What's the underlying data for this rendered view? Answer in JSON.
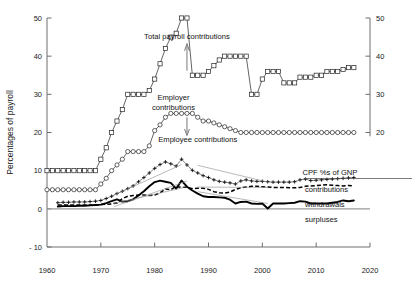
{
  "chart_data": {
    "type": "line",
    "title": "",
    "xlabel": "",
    "ylabel": "Percentages of payroll",
    "xlim": [
      1960,
      2020
    ],
    "ylim": [
      -10,
      50
    ],
    "xticks": [
      "1960",
      "1970",
      "1980",
      "1990",
      "2000",
      "2010",
      "2020"
    ],
    "xtick_values": [
      1960,
      1970,
      1980,
      1990,
      2000,
      2010,
      2020
    ],
    "yticks_left": [
      "50",
      "40",
      "30",
      "20",
      "10",
      "0",
      "- 10"
    ],
    "ytick_values_left": [
      50,
      40,
      30,
      20,
      10,
      0,
      -10
    ],
    "yticks_right": [
      "50",
      "40",
      "30",
      "20"
    ],
    "ytick_values_right": [
      50,
      40,
      30,
      20
    ],
    "grid": false,
    "legend_position": "right-inside",
    "legend_title": "CPF %s of GNP",
    "annotations": [
      {
        "text": "Total payroll contributions",
        "x": 1986,
        "y": 44.5
      },
      {
        "text": "Employer",
        "x": 1983.5,
        "y": 28.5
      },
      {
        "text": "contributions",
        "x": 1983.5,
        "y": 26.0
      },
      {
        "text": "Employee contributions",
        "x": 1988,
        "y": 17.5
      }
    ],
    "series": [
      {
        "name": "Total payroll contributions",
        "marker": "square",
        "x": [
          1960,
          1961,
          1962,
          1963,
          1964,
          1965,
          1966,
          1967,
          1968,
          1969,
          1970,
          1971,
          1972,
          1973,
          1974,
          1975,
          1976,
          1977,
          1978,
          1979,
          1980,
          1981,
          1982,
          1983,
          1984,
          1985,
          1986,
          1987,
          1988,
          1989,
          1990,
          1991,
          1992,
          1993,
          1994,
          1995,
          1996,
          1997,
          1998,
          1999,
          2000,
          2001,
          2002,
          2003,
          2004,
          2005,
          2006,
          2007,
          2008,
          2009,
          2010,
          2011,
          2012,
          2013,
          2014,
          2015,
          2016,
          2017
        ],
        "values": [
          10,
          10,
          10,
          10,
          10,
          10,
          10,
          10,
          10,
          10,
          13,
          16,
          20,
          23,
          26,
          30,
          30,
          30,
          30,
          31,
          34,
          38,
          42,
          45,
          46,
          50,
          50,
          35,
          35,
          35,
          36,
          37.5,
          39,
          40,
          40,
          40,
          40,
          40,
          30,
          30,
          34,
          36,
          36,
          36,
          33,
          33,
          33,
          34.5,
          34.5,
          34.5,
          35,
          35,
          36,
          36,
          36,
          36.5,
          37,
          37
        ]
      },
      {
        "name": "Employer contributions",
        "marker": "circle",
        "x": [
          1960,
          1961,
          1962,
          1963,
          1964,
          1965,
          1966,
          1967,
          1968,
          1969,
          1970,
          1971,
          1972,
          1973,
          1974,
          1975,
          1976,
          1977,
          1978,
          1979,
          1980,
          1981,
          1982,
          1983,
          1984,
          1985,
          1986,
          1987,
          1988,
          1989,
          1990,
          1991,
          1992,
          1993,
          1994,
          1995,
          1996,
          1997,
          1998,
          1999,
          2000,
          2001,
          2002,
          2003,
          2004,
          2005,
          2006,
          2007,
          2008,
          2009,
          2010,
          2011,
          2012,
          2013,
          2014,
          2015,
          2016,
          2017
        ],
        "values": [
          5,
          5,
          5,
          5,
          5,
          5,
          5,
          5,
          5,
          5,
          6.5,
          8,
          10,
          11.5,
          13,
          15,
          15,
          15,
          15,
          16.5,
          20.5,
          22,
          24,
          25,
          25,
          25,
          25,
          25,
          24,
          23,
          23,
          22.5,
          22,
          21.5,
          21,
          20.5,
          20,
          20,
          20,
          20,
          20,
          20,
          20,
          20,
          20,
          20,
          20,
          20,
          20,
          20,
          20,
          20,
          20,
          20,
          20,
          20,
          20,
          20
        ]
      },
      {
        "name": "contributions",
        "marker": "plus",
        "x": [
          1962,
          1963,
          1964,
          1965,
          1966,
          1967,
          1968,
          1969,
          1970,
          1971,
          1972,
          1973,
          1974,
          1975,
          1976,
          1977,
          1978,
          1979,
          1980,
          1981,
          1982,
          1983,
          1984,
          1985,
          1986,
          1987,
          1988,
          1989,
          1990,
          1991,
          1992,
          1993,
          1994,
          1995,
          1996,
          1997,
          1998,
          1999,
          2000,
          2001,
          2002,
          2003,
          2004,
          2005,
          2006,
          2007,
          2008,
          2009,
          2010,
          2011,
          2012,
          2013,
          2014,
          2015,
          2016,
          2017
        ],
        "values": [
          1.6,
          1.7,
          1.7,
          1.8,
          1.8,
          1.8,
          1.9,
          2.0,
          2.2,
          2.7,
          3.3,
          4.0,
          4.6,
          5.3,
          6.0,
          7.1,
          8.2,
          9.4,
          10.6,
          11.6,
          12.3,
          11.8,
          11.2,
          13.0,
          11.5,
          10.1,
          9.4,
          8.7,
          8.2,
          7.6,
          7.2,
          7.0,
          6.8,
          6.5,
          7.3,
          7.6,
          7.3,
          7.2,
          7.2,
          7.1,
          7.0,
          7.0,
          7.0,
          7.0,
          7.1,
          7.6,
          7.8,
          7.4,
          7.5,
          7.6,
          7.7,
          7.8,
          7.9,
          8.0,
          8.1,
          8.2
        ]
      },
      {
        "name": "withdrawals",
        "marker": "dash",
        "x": [
          1962,
          1963,
          1964,
          1965,
          1966,
          1967,
          1968,
          1969,
          1970,
          1971,
          1972,
          1973,
          1974,
          1975,
          1976,
          1977,
          1978,
          1979,
          1980,
          1981,
          1982,
          1983,
          1984,
          1985,
          1986,
          1987,
          1988,
          1989,
          1990,
          1991,
          1992,
          1993,
          1994,
          1995,
          1996,
          1997,
          1998,
          1999,
          2000,
          2001,
          2002,
          2003,
          2004,
          2005,
          2006,
          2007,
          2008,
          2009,
          2010,
          2011,
          2012,
          2013,
          2014,
          2015,
          2016,
          2017
        ],
        "values": [
          1.0,
          1.0,
          1.0,
          1.0,
          1.0,
          1.0,
          1.0,
          1.0,
          1.1,
          1.2,
          1.3,
          1.5,
          2.7,
          3.3,
          3.5,
          3.6,
          3.6,
          3.5,
          3.6,
          4.2,
          5.2,
          5.0,
          5.9,
          5.6,
          5.7,
          5.3,
          5.4,
          5.4,
          5.1,
          4.5,
          4.2,
          4.1,
          4.4,
          5.1,
          5.5,
          5.7,
          5.9,
          5.9,
          5.8,
          5.7,
          5.6,
          5.6,
          5.6,
          5.5,
          5.5,
          5.6,
          5.9,
          6.0,
          6.1,
          6.2,
          6.3,
          6.2,
          6.1,
          6.0,
          6.1,
          6.0
        ]
      },
      {
        "name": "surpluses",
        "marker": "square-filled",
        "x": [
          1962,
          1963,
          1964,
          1965,
          1966,
          1967,
          1968,
          1969,
          1970,
          1971,
          1972,
          1973,
          1974,
          1975,
          1976,
          1977,
          1978,
          1979,
          1980,
          1981,
          1982,
          1983,
          1984,
          1985,
          1986,
          1987,
          1988,
          1989,
          1990,
          1991,
          1992,
          1993,
          1994,
          1995,
          1996,
          1997,
          1998,
          1999,
          2000,
          2001,
          2002,
          2003,
          2004,
          2005,
          2006,
          2007,
          2008,
          2009,
          2010,
          2011,
          2012,
          2013,
          2014,
          2015,
          2016,
          2017
        ],
        "values": [
          0.6,
          0.7,
          0.7,
          0.7,
          0.8,
          0.8,
          0.9,
          1.0,
          1.1,
          1.5,
          2.0,
          2.5,
          1.9,
          2.0,
          2.5,
          3.5,
          4.6,
          5.9,
          7.0,
          7.4,
          7.1,
          6.8,
          5.3,
          7.4,
          5.8,
          4.8,
          4.0,
          3.3,
          3.1,
          3.1,
          3.0,
          2.9,
          2.4,
          1.4,
          1.8,
          1.9,
          1.4,
          1.3,
          1.4,
          0.1,
          1.4,
          1.4,
          1.4,
          1.5,
          1.6,
          2.0,
          1.9,
          1.4,
          1.4,
          1.4,
          1.4,
          1.6,
          1.8,
          2.2,
          2.0,
          2.2
        ]
      }
    ],
    "legend_entries": [
      {
        "label": "contributions"
      },
      {
        "label": "withdrawals"
      },
      {
        "label": "surpluses"
      }
    ]
  },
  "colors": {
    "axis": "#6e6e6e",
    "series_line": "#222222",
    "marker_fill": "#ffffff",
    "thick_line": "#000000",
    "text": "#111111"
  }
}
